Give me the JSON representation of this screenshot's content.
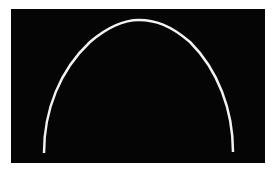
{
  "image": {
    "background_color": "#ffffff",
    "panel_color": "#050505",
    "curve_color": "#f2f2f2",
    "shape": "arch-curve"
  }
}
